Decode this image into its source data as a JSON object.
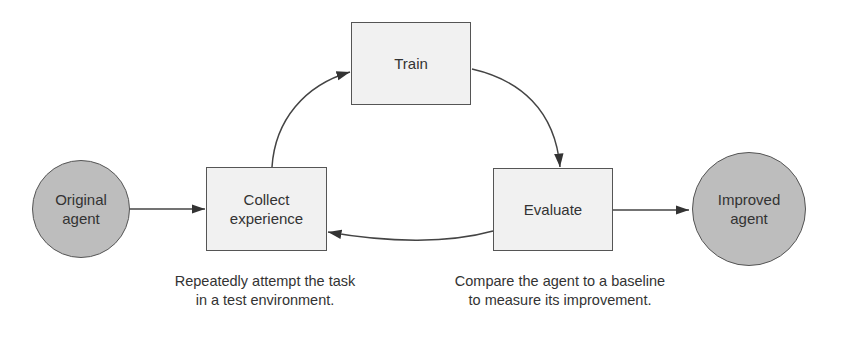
{
  "diagram": {
    "nodes": [
      {
        "id": "original",
        "label_line1": "Original",
        "label_line2": "agent",
        "shape": "circle"
      },
      {
        "id": "collect",
        "label_line1": "Collect",
        "label_line2": "experience",
        "shape": "box"
      },
      {
        "id": "train",
        "label": "Train",
        "shape": "box"
      },
      {
        "id": "evaluate",
        "label": "Evaluate",
        "shape": "box"
      },
      {
        "id": "improved",
        "label_line1": "Improved",
        "label_line2": "agent",
        "shape": "circle"
      }
    ],
    "edges": [
      {
        "from": "original",
        "to": "collect"
      },
      {
        "from": "collect",
        "to": "train"
      },
      {
        "from": "train",
        "to": "evaluate"
      },
      {
        "from": "evaluate",
        "to": "collect"
      },
      {
        "from": "evaluate",
        "to": "improved"
      }
    ],
    "captions": {
      "collect_line1": "Repeatedly attempt the task",
      "collect_line2": "in a test environment.",
      "evaluate_line1": "Compare the agent to a baseline",
      "evaluate_line2": "to measure its improvement."
    },
    "colors": {
      "circle_fill": "#bdbdbd",
      "box_fill": "#f1f1f1",
      "stroke": "#555555"
    }
  }
}
